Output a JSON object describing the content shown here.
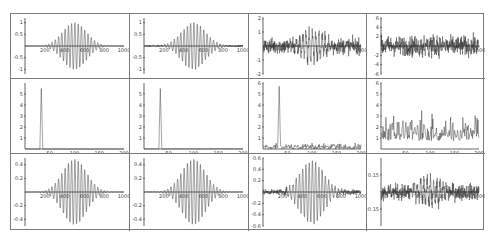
{
  "layout": {
    "rows": 3,
    "cols": 4
  },
  "colors": {
    "line": "#333333",
    "axis": "#222222",
    "border": "#7a7a7a",
    "tick_text": "#444444"
  },
  "chart_data": [
    {
      "type": "line",
      "row": 0,
      "col": 0,
      "title": "",
      "xlabel": "",
      "ylabel": "",
      "signal": "gaussian-modulated sinusoid",
      "xlim": [
        0,
        1000
      ],
      "ylim": [
        -1.2,
        1.2
      ],
      "xticks": [
        200,
        400,
        600,
        800,
        1000
      ],
      "yticks": [
        1.0,
        0.5,
        -0.5,
        -1.0
      ],
      "peak_amplitude": 1.0,
      "center": 500,
      "noise": 0.0
    },
    {
      "type": "line",
      "row": 0,
      "col": 1,
      "title": "",
      "xlabel": "",
      "ylabel": "",
      "signal": "gaussian-modulated sinusoid + low noise",
      "xlim": [
        0,
        1000
      ],
      "ylim": [
        -1.2,
        1.2
      ],
      "xticks": [
        200,
        400,
        600,
        800,
        1000
      ],
      "yticks": [
        1.0,
        0.5,
        -0.5,
        -1.0
      ],
      "peak_amplitude": 1.0,
      "center": 500,
      "noise": 0.05
    },
    {
      "type": "line",
      "row": 0,
      "col": 2,
      "title": "",
      "xlabel": "",
      "ylabel": "",
      "signal": "gaussian-modulated sinusoid + medium noise",
      "xlim": [
        0,
        1000
      ],
      "ylim": [
        -2,
        2
      ],
      "xticks": [
        1000
      ],
      "yticks": [
        2,
        1,
        -1,
        -2
      ],
      "peak_amplitude": 1.0,
      "center": 500,
      "noise": 0.8
    },
    {
      "type": "line",
      "row": 0,
      "col": 3,
      "title": "",
      "xlabel": "",
      "ylabel": "",
      "signal": "gaussian-modulated sinusoid + high noise",
      "xlim": [
        0,
        1000
      ],
      "ylim": [
        -6,
        6
      ],
      "xticks": [
        1000
      ],
      "yticks": [
        6,
        4,
        2,
        -2,
        -4,
        -6
      ],
      "peak_amplitude": 1.0,
      "center": 500,
      "noise": 3.0
    },
    {
      "type": "line",
      "row": 1,
      "col": 0,
      "title": "",
      "xlabel": "",
      "ylabel": "",
      "signal": "spectrum magnitude",
      "xlim": [
        0,
        200
      ],
      "ylim": [
        0,
        6
      ],
      "xticks": [
        50,
        100,
        150,
        200
      ],
      "yticks": [
        1,
        2,
        3,
        4,
        5
      ],
      "peak_x": 33,
      "peak_y": 5.5,
      "noise_floor": 0.0
    },
    {
      "type": "line",
      "row": 1,
      "col": 1,
      "title": "",
      "xlabel": "",
      "ylabel": "",
      "signal": "spectrum magnitude",
      "xlim": [
        0,
        200
      ],
      "ylim": [
        0,
        6
      ],
      "xticks": [
        50,
        100,
        150,
        200
      ],
      "yticks": [
        1,
        2,
        3,
        4,
        5
      ],
      "peak_x": 33,
      "peak_y": 5.5,
      "noise_floor": 0.05
    },
    {
      "type": "line",
      "row": 1,
      "col": 2,
      "title": "",
      "xlabel": "",
      "ylabel": "",
      "signal": "spectrum magnitude",
      "xlim": [
        0,
        200
      ],
      "ylim": [
        0,
        6
      ],
      "xticks": [
        50,
        100,
        150,
        200
      ],
      "yticks": [
        1,
        2,
        3,
        4,
        5,
        6
      ],
      "peak_x": 33,
      "peak_y": 5.7,
      "noise_floor": 0.6
    },
    {
      "type": "line",
      "row": 1,
      "col": 3,
      "title": "",
      "xlabel": "",
      "ylabel": "",
      "signal": "spectrum magnitude",
      "xlim": [
        0,
        200
      ],
      "ylim": [
        0,
        6
      ],
      "xticks": [
        50,
        100,
        150,
        200
      ],
      "yticks": [
        1,
        2,
        3,
        4,
        5,
        6
      ],
      "peak_x": null,
      "peak_y": null,
      "noise_floor": 2.5
    },
    {
      "type": "line",
      "row": 2,
      "col": 0,
      "title": "",
      "xlabel": "",
      "ylabel": "",
      "signal": "reconstructed signal",
      "xlim": [
        0,
        1000
      ],
      "ylim": [
        -0.5,
        0.5
      ],
      "xticks": [
        200,
        400,
        600,
        800,
        1000
      ],
      "yticks": [
        0.4,
        0.2,
        -0.2,
        -0.4
      ],
      "peak_amplitude": 0.48,
      "center": 500,
      "noise": 0.0
    },
    {
      "type": "line",
      "row": 2,
      "col": 1,
      "title": "",
      "xlabel": "",
      "ylabel": "",
      "signal": "reconstructed signal",
      "xlim": [
        0,
        1000
      ],
      "ylim": [
        -0.5,
        0.5
      ],
      "xticks": [
        200,
        400,
        600,
        800,
        1000
      ],
      "yticks": [
        0.4,
        0.2,
        -0.2,
        -0.4
      ],
      "peak_amplitude": 0.48,
      "center": 500,
      "noise": 0.005
    },
    {
      "type": "line",
      "row": 2,
      "col": 2,
      "title": "",
      "xlabel": "",
      "ylabel": "",
      "signal": "reconstructed signal",
      "xlim": [
        0,
        1000
      ],
      "ylim": [
        -0.6,
        0.6
      ],
      "xticks": [
        200,
        400,
        600,
        800,
        1000
      ],
      "yticks": [
        0.6,
        0.4,
        0.2,
        -0.2,
        -0.4,
        -0.6
      ],
      "peak_amplitude": 0.55,
      "center": 500,
      "noise": 0.06
    },
    {
      "type": "line",
      "row": 2,
      "col": 3,
      "title": "",
      "xlabel": "",
      "ylabel": "",
      "signal": "reconstructed signal",
      "xlim": [
        0,
        1000
      ],
      "ylim": [
        -0.3,
        0.3
      ],
      "xticks": [
        200,
        400,
        600,
        800,
        1000
      ],
      "yticks": [
        0.15,
        -0.15
      ],
      "peak_amplitude": 0.1,
      "center": 500,
      "noise": 0.1
    }
  ]
}
